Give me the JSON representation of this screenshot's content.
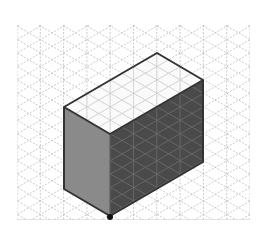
{
  "diagram": {
    "grid": {
      "left": 17,
      "right": 250,
      "top": 25,
      "bottom": 220,
      "spacing_x": 23.3,
      "line_color": "#bdbdbd"
    },
    "prism": {
      "vertices": {
        "top_back": [
          157,
          53
        ],
        "top_right": [
          203,
          80
        ],
        "top_left": [
          64,
          107
        ],
        "top_front": [
          110,
          134
        ],
        "bottom_front": [
          110,
          216
        ],
        "bottom_left": [
          64,
          189
        ],
        "bottom_right": [
          203,
          162
        ]
      },
      "colors": {
        "top_face": "#f7f7f7",
        "left_face": "#8a8a8a",
        "right_face": "#4a4a4a",
        "edge": "#333333",
        "vertex_dot": "#111111"
      }
    }
  }
}
